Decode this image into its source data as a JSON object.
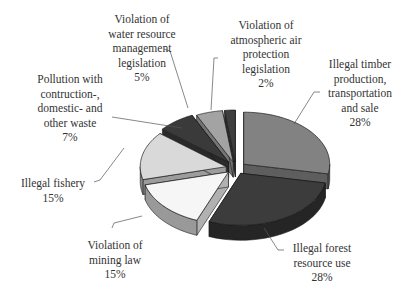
{
  "chart_data": {
    "type": "pie",
    "style": "3d-exploded",
    "title": "",
    "start_angle": "12 o'clock",
    "direction": "clockwise",
    "categories": [
      "Illegal timber production, transportation and sale",
      "Illegal forest resource use",
      "Violation of mining law",
      "Illegal fishery",
      "Pollution with contruction-, domestic- and other waste",
      "Violation of water resource management legislation",
      "Violation of atmospheric air protection legislation"
    ],
    "values": [
      28,
      28,
      15,
      15,
      7,
      5,
      2
    ],
    "unit": "%",
    "colors": [
      "#828282",
      "#3c3c3c",
      "#f6f6f6",
      "#d9d9d9",
      "#3a3a3a",
      "#a3a3a3",
      "#3e3e3e"
    ],
    "legend": "none (data labels with leader lines)"
  },
  "labels": [
    {
      "text": "Illegal timber\nproduction,\ntransportation\nand sale",
      "pct": "28%"
    },
    {
      "text": "Illegal forest\nresource use",
      "pct": "28%"
    },
    {
      "text": "Violation of\nmining law",
      "pct": "15%"
    },
    {
      "text": "Illegal fishery",
      "pct": "15%"
    },
    {
      "text": "Pollution with\ncontruction-,\ndomestic- and\nother waste",
      "pct": "7%"
    },
    {
      "text": "Violation of\nwater resource\nmanagement\nlegislation",
      "pct": "5%"
    },
    {
      "text": "Violation of\natmospheric air\nprotection\nlegislation",
      "pct": "2%"
    }
  ]
}
